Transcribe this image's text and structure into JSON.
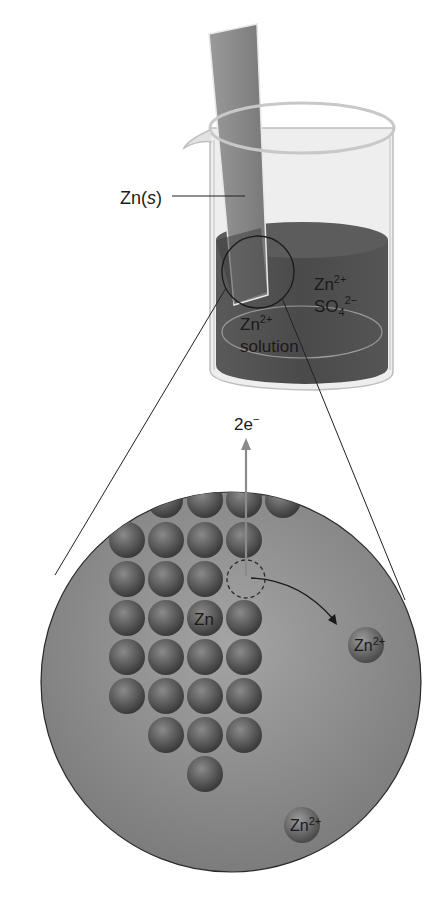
{
  "diagram": {
    "beaker": {
      "electrode_label": "Zn(",
      "electrode_label_state": "s",
      "electrode_label_close": ")",
      "solution_ions": {
        "cation": "Zn",
        "cation_charge": "2+",
        "anion": "SO",
        "anion_subscript": "4",
        "anion_charge": "2−"
      },
      "solution_label": {
        "ion": "Zn",
        "charge": "2+",
        "word": "solution"
      }
    },
    "magnified_view": {
      "electron_label": "2e",
      "electron_charge": "−",
      "metal_atom_label": "Zn",
      "released_ion_label": "Zn",
      "released_ion_charge": "2+",
      "solution_ion_label": "Zn",
      "solution_ion_charge": "2+",
      "atom_rows": [
        4,
        4,
        3,
        4,
        4,
        4,
        3,
        1
      ]
    },
    "colors": {
      "solution": "#4a4a4a",
      "electrode": "#8a8a8a",
      "atom": "#555555",
      "magnified_bg": "#8e8e8e",
      "electron_arrow": "#8a8a8a",
      "outline": "#222222"
    }
  }
}
